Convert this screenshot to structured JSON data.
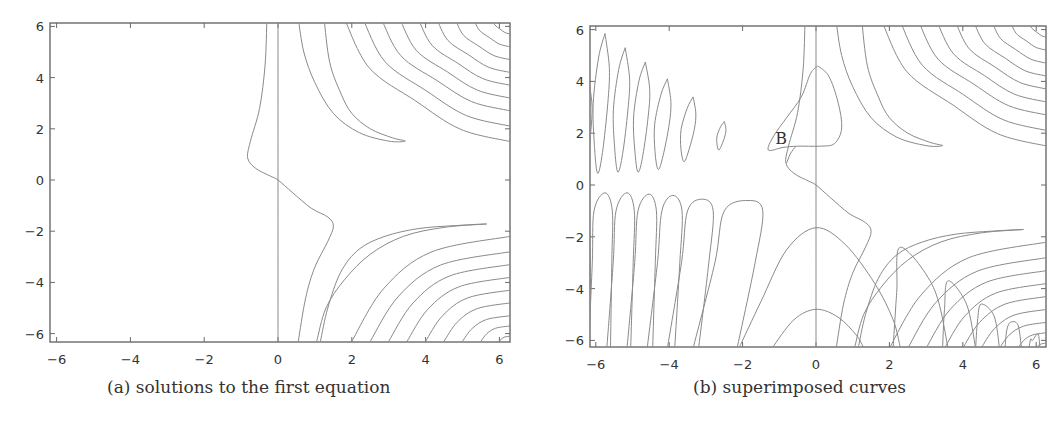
{
  "figure": {
    "panels": [
      {
        "id": "a",
        "caption": "(a) solutions to the first equation",
        "xticks": [
          "−6",
          "−4",
          "−2",
          "0",
          "2",
          "4",
          "6"
        ],
        "yticks": [
          "6",
          "4",
          "2",
          "0",
          "−2",
          "−4",
          "−6"
        ]
      },
      {
        "id": "b",
        "caption": "(b) superimposed curves",
        "annotation": "B",
        "xticks": [
          "−6",
          "−4",
          "−2",
          "0",
          "2",
          "4",
          "6"
        ],
        "yticks": [
          "6",
          "4",
          "2",
          "0",
          "−2",
          "−4",
          "−6"
        ]
      }
    ],
    "colors": {
      "curve": "#8a8a8a",
      "frame": "#6a6a6a",
      "text": "#333333"
    }
  },
  "chart_data": [
    {
      "type": "line",
      "subtype": "contour",
      "title": "(a) solutions to the first equation",
      "xlabel": "",
      "ylabel": "",
      "xlim": [
        -6.2,
        6.2
      ],
      "ylim": [
        -6.2,
        6.2
      ],
      "xticks": [
        -6,
        -4,
        -2,
        0,
        2,
        4,
        6
      ],
      "yticks": [
        -6,
        -4,
        -2,
        0,
        2,
        4,
        6
      ],
      "grid": false,
      "legend": null,
      "description": "Implicit solution curves: vertical line x=0; an S-shaped curve crossing origin (from (-0.3,6) down to (-0.8,0.8), through (0,0), to (1.5,-1.8), down to (0.5,-6)); family of hyperbola-like curves in quadrant I (upper right) with a hook tip near (3.4,1.5); family of curves in quadrant IV (lower right) with a hook tip near (5.6,-1.7)."
    },
    {
      "type": "line",
      "subtype": "contour",
      "title": "(b) superimposed curves",
      "xlabel": "",
      "ylabel": "",
      "xlim": [
        -6.2,
        6.2
      ],
      "ylim": [
        -6.2,
        6.2
      ],
      "xticks": [
        -6,
        -4,
        -2,
        0,
        2,
        4,
        6
      ],
      "yticks": [
        -6,
        -4,
        -2,
        0,
        2,
        4,
        6
      ],
      "grid": false,
      "legend": null,
      "annotations": [
        {
          "text": "B",
          "x": -0.9,
          "y": 1.9
        }
      ],
      "description": "Curves from (a) superimposed with a second family: tilted closed ovals in upper-left (x≈-5.8..-2.5, y≈0.4..5.8, shrinking toward the right), elongated arches in lower-left (tops at y≈-0.3..-0.8), a closed triangular loop around x=0 spanning y≈1.3..4.6, parabolic arches centered at x=0 with tops at y≈-1.6 and y≈-4.8, and narrow arches in lower right with tops at (2.3,-2.4),(3.6,-3.7),(4.5,-4.6),(5.3,-5.3),(5.9,-6)."
    }
  ]
}
